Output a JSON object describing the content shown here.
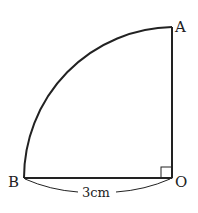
{
  "diagram": {
    "type": "quarter-circle sector",
    "points": {
      "A": {
        "label": "A",
        "x": 172,
        "y": 27
      },
      "B": {
        "label": "B",
        "x": 24,
        "y": 178
      },
      "O": {
        "label": "O",
        "x": 172,
        "y": 178
      }
    },
    "right_angle_at": "O",
    "dimension": {
      "from": "B",
      "to": "O",
      "label": "3cm"
    },
    "stroke_color": "#222222"
  }
}
